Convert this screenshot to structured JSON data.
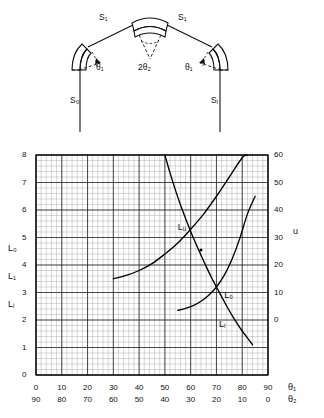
{
  "figure": {
    "schematic": {
      "name": "double-crystal-spectrometer-schematic",
      "components": [
        {
          "id": "left-crystal",
          "label": "left curved crystal"
        },
        {
          "id": "center-crystal",
          "label": "center curved crystal"
        },
        {
          "id": "right-crystal",
          "label": "right curved crystal"
        }
      ],
      "labels": {
        "beam_left": {
          "base": "S",
          "sub": "1"
        },
        "beam_right": {
          "base": "S",
          "sub": "1"
        },
        "center_angle": {
          "prefix": "2",
          "base": "θ",
          "sub": "2"
        },
        "angle_left": {
          "base": "θ",
          "sub": "1"
        },
        "angle_right": {
          "base": "θ",
          "sub": "1"
        },
        "source": {
          "base": "S",
          "sub": "o"
        },
        "image": {
          "base": "S",
          "sub": "i"
        }
      },
      "text": {
        "beam_left": "S₁",
        "beam_right": "S₁",
        "center_angle": "2θ₂",
        "angle_left": "θ₁",
        "angle_right": "θ₁",
        "source": "S₀",
        "image": "Sᵢ"
      }
    }
  },
  "chart_data": {
    "type": "line",
    "title": "",
    "grid": "on",
    "legend": "inline-curve-labels",
    "axes": {
      "left": {
        "label_text": "",
        "series_labels": [
          "L₀",
          "L₁",
          "Lᵢ"
        ],
        "ylim": [
          0,
          8
        ],
        "major_step": 1,
        "minor_per_major": 5,
        "ticks": [
          "0",
          "1",
          "2",
          "3",
          "4",
          "5",
          "6",
          "7",
          "8"
        ]
      },
      "right": {
        "label_text": "u",
        "ylim": [
          -15,
          60
        ],
        "major_step": 10,
        "ticks": [
          "0",
          "10",
          "20",
          "30",
          "40",
          "50",
          "60"
        ],
        "tick_positions_left_units": [
          2,
          3,
          4,
          5,
          6,
          7,
          8
        ]
      },
      "bottom_primary": {
        "label_text": "θ₁",
        "xlim": [
          0,
          90
        ],
        "major_step": 10,
        "ticks": [
          "0",
          "10",
          "20",
          "30",
          "40",
          "50",
          "60",
          "70",
          "80",
          "90"
        ]
      },
      "bottom_secondary": {
        "label_text": "θ₂",
        "xlim": [
          90,
          0
        ],
        "major_step": 10,
        "ticks": [
          "90",
          "80",
          "70",
          "60",
          "50",
          "40",
          "30",
          "20",
          "10",
          "0"
        ]
      }
    },
    "series": [
      {
        "name": "L_u",
        "label": "Lᵤ",
        "axis": "left",
        "label_x": 55,
        "label_y": 5.55,
        "x": [
          50,
          52,
          54,
          56,
          58,
          60,
          62,
          64,
          66,
          68,
          70,
          72,
          74,
          76,
          78,
          80,
          82,
          84
        ],
        "y": [
          8.0,
          7.35,
          6.75,
          6.2,
          5.7,
          5.22,
          4.78,
          4.36,
          3.95,
          3.56,
          3.2,
          2.85,
          2.5,
          2.18,
          1.88,
          1.6,
          1.35,
          1.1
        ]
      },
      {
        "name": "L_o",
        "label": "L₀",
        "axis": "left",
        "label_x": 73,
        "label_y": 3.1,
        "x": [
          30,
          35,
          40,
          45,
          50,
          55,
          60,
          65,
          70,
          75,
          80,
          82
        ],
        "y": [
          3.5,
          3.62,
          3.8,
          4.05,
          4.4,
          4.8,
          5.3,
          5.85,
          6.5,
          7.2,
          7.9,
          8.0
        ]
      },
      {
        "name": "L_i",
        "label": "Lᵢ",
        "axis": "left",
        "label_x": 71,
        "label_y": 2.05,
        "x": [
          55,
          58,
          61,
          64,
          67,
          70,
          73,
          76,
          79,
          82,
          85
        ],
        "y": [
          2.35,
          2.42,
          2.52,
          2.68,
          2.9,
          3.2,
          3.62,
          4.2,
          4.95,
          5.85,
          6.5
        ]
      }
    ],
    "annotations": [
      {
        "type": "point-marker",
        "x": 64,
        "y": 4.55,
        "label": ""
      }
    ]
  }
}
